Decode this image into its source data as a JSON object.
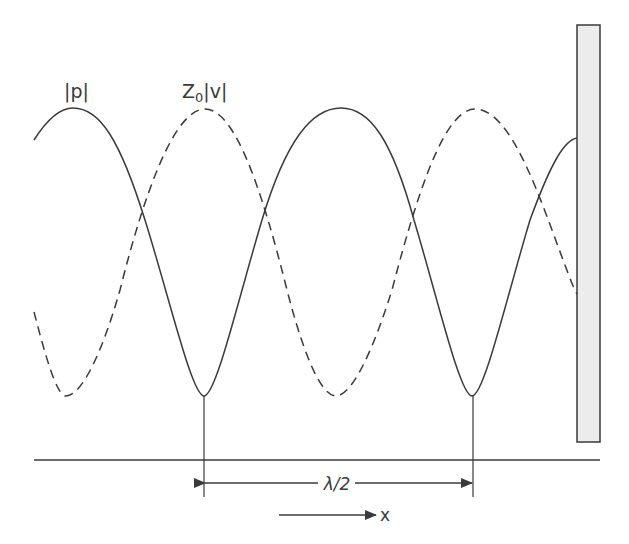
{
  "figure": {
    "labels": {
      "pressure": "|p|",
      "velocity_prefix": "Z",
      "velocity_sub": "0",
      "velocity_suffix": "|v|",
      "half_wavelength": "λ/2",
      "x_axis": "x"
    },
    "colors": {
      "line": "#3a3a3a",
      "wall_fill": "#ececec",
      "wall_stroke": "#3a3a3a",
      "background": "#ffffff"
    },
    "curves": [
      {
        "name": "pressure-magnitude",
        "style": "solid"
      },
      {
        "name": "velocity-magnitude",
        "style": "dashed"
      }
    ]
  }
}
